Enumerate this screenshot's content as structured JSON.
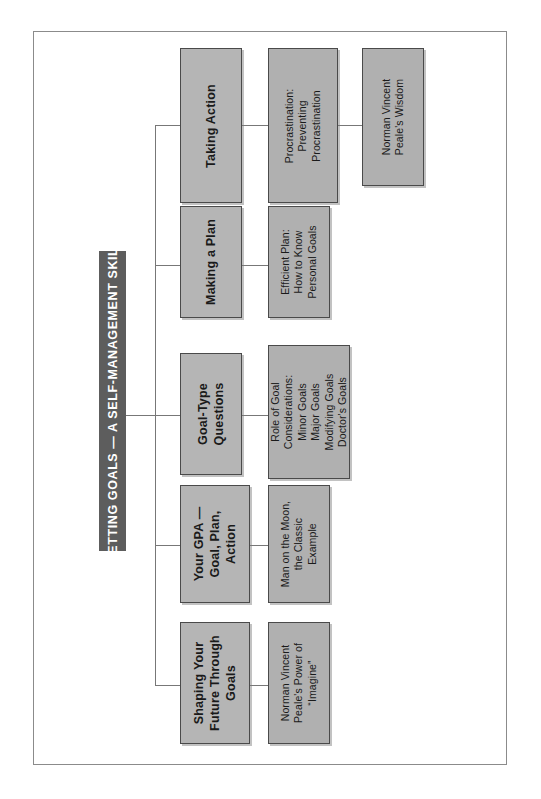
{
  "diagram": {
    "title": "SETTING GOALS — A SELF-MANAGEMENT SKILL",
    "orientation": "rotated-90-ccw",
    "colors": {
      "title_bar_background": "#5d5d5d",
      "title_bar_text": "#ffffff",
      "node_background": "#b5b5b5",
      "node_border": "#4a4a4a",
      "connector": "#777777",
      "page_background": "#ffffff",
      "page_frame": "#8b8b8b"
    },
    "branches": [
      {
        "main": "Shaping Your\nFuture Through\nGoals",
        "main_lines": [
          "Shaping Your",
          "Future Through",
          "Goals"
        ],
        "sub": "Norman Vincent\nPeale's Power of\n“Imagine”",
        "sub_lines": [
          "Norman Vincent",
          "Peale's Power of",
          "“Imagine”"
        ]
      },
      {
        "main": "Your GPA —\nGoal, Plan,\nAction",
        "main_lines": [
          "Your GPA —",
          "Goal, Plan,",
          "Action"
        ],
        "sub": "Man on the Moon,\nthe Classic\nExample",
        "sub_lines": [
          "Man on the Moon,",
          "the Classic",
          "Example"
        ]
      },
      {
        "main": "Goal-Type\nQuestions",
        "main_lines": [
          "Goal-Type",
          "Questions"
        ],
        "sub": "Role of Goal\nConsiderations:\nMinor Goals\nMajor Goals\nModifying Goals\nDoctor's Goals",
        "sub_lines": [
          "Role of Goal",
          "Considerations:",
          "Minor Goals",
          "Major Goals",
          "Modifying Goals",
          "Doctor's Goals"
        ]
      },
      {
        "main": "Making a Plan",
        "main_lines": [
          "Making a Plan"
        ],
        "sub": "Efficient Plan:\nHow to Know\nPersonal Goals",
        "sub_lines": [
          "Efficient Plan:",
          "How to Know",
          "Personal Goals"
        ]
      },
      {
        "main": "Taking Action",
        "main_lines": [
          "Taking Action"
        ],
        "sub": "Procrastination:\nPreventing\nProcrastination",
        "sub_lines": [
          "Procrastination:",
          "Preventing",
          "Procrastination"
        ],
        "sub2": "Norman Vincent\nPeale's Wisdom",
        "sub2_lines": [
          "Norman Vincent",
          "Peale's Wisdom"
        ]
      }
    ]
  }
}
